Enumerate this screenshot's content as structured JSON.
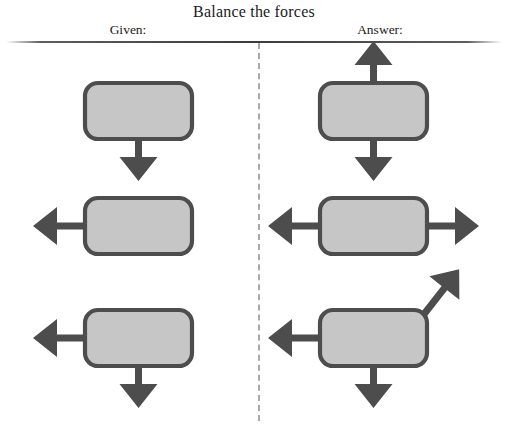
{
  "title": "Balance the forces",
  "columns": {
    "given_label": "Given:",
    "answer_label": "Answer:"
  },
  "colors": {
    "body_fill": "#c6c6c6",
    "body_stroke": "#4d4d4d",
    "arrow": "#4d4d4d",
    "rule": "#3c3c3c",
    "divider": "#a9a9a9",
    "background": "#ffffff",
    "text": "#1b1b1b"
  },
  "problems": [
    {
      "id": "row-1",
      "given": {
        "body": {
          "x": 85,
          "y": 83,
          "w": 107,
          "h": 56
        },
        "forces": [
          {
            "name": "force-down",
            "direction": "down",
            "angle_deg": 270,
            "length": 42
          }
        ]
      },
      "answer": {
        "body": {
          "x": 320,
          "y": 83,
          "w": 107,
          "h": 56
        },
        "forces": [
          {
            "name": "force-down",
            "direction": "down",
            "angle_deg": 270,
            "length": 42
          },
          {
            "name": "force-up",
            "direction": "up",
            "angle_deg": 90,
            "length": 42
          }
        ]
      }
    },
    {
      "id": "row-2",
      "given": {
        "body": {
          "x": 85,
          "y": 198,
          "w": 107,
          "h": 56
        },
        "forces": [
          {
            "name": "force-left",
            "direction": "left",
            "angle_deg": 180,
            "length": 52
          }
        ]
      },
      "answer": {
        "body": {
          "x": 320,
          "y": 198,
          "w": 107,
          "h": 56
        },
        "forces": [
          {
            "name": "force-left",
            "direction": "left",
            "angle_deg": 180,
            "length": 52
          },
          {
            "name": "force-right",
            "direction": "right",
            "angle_deg": 0,
            "length": 52
          }
        ]
      }
    },
    {
      "id": "row-3",
      "given": {
        "body": {
          "x": 85,
          "y": 310,
          "w": 107,
          "h": 56
        },
        "forces": [
          {
            "name": "force-left",
            "direction": "left",
            "angle_deg": 180,
            "length": 52
          },
          {
            "name": "force-down",
            "direction": "down",
            "angle_deg": 270,
            "length": 42
          }
        ]
      },
      "answer": {
        "body": {
          "x": 320,
          "y": 310,
          "w": 107,
          "h": 56
        },
        "forces": [
          {
            "name": "force-left",
            "direction": "left",
            "angle_deg": 180,
            "length": 52
          },
          {
            "name": "force-down",
            "direction": "down",
            "angle_deg": 270,
            "length": 42
          },
          {
            "name": "force-diagonal-up-right",
            "direction": "up-right",
            "angle_deg": 52,
            "length": 62
          }
        ]
      }
    }
  ]
}
